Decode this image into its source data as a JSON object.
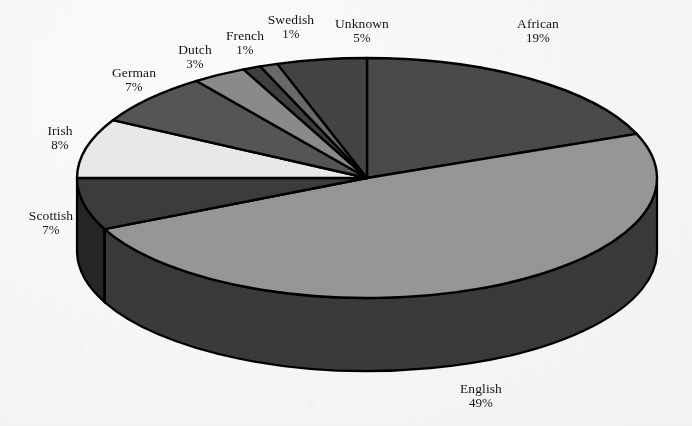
{
  "chart_data": {
    "type": "pie",
    "title": "",
    "subtitle": "",
    "xlabel": "",
    "ylabel": "",
    "legend_position": "none",
    "grid": false,
    "style": "3d-exploded-none",
    "label_format": "name + percent",
    "rotation_start_deg": 0,
    "direction": "clockwise",
    "categories": [
      "African",
      "English",
      "Scottish",
      "Irish",
      "German",
      "Dutch",
      "French",
      "Swedish",
      "Unknown"
    ],
    "values": [
      19,
      49,
      7,
      8,
      7,
      3,
      1,
      1,
      5
    ],
    "value_labels": [
      "19%",
      "49%",
      "7%",
      "8%",
      "7%",
      "3%",
      "1%",
      "1%",
      "5%"
    ],
    "unit": "%",
    "total": 100,
    "slices": [
      {
        "label": "African",
        "percent": 19,
        "percent_label": "19%",
        "color": "#4a4a4a",
        "side_color": "#2e2e2e"
      },
      {
        "label": "English",
        "percent": 49,
        "percent_label": "49%",
        "color": "#969696",
        "side_color": "#3a3a3a"
      },
      {
        "label": "Scottish",
        "percent": 7,
        "percent_label": "7%",
        "color": "#3c3c3c",
        "side_color": "#262626"
      },
      {
        "label": "Irish",
        "percent": 8,
        "percent_label": "8%",
        "color": "#e8e8e8",
        "side_color": "#4a4a4a"
      },
      {
        "label": "German",
        "percent": 7,
        "percent_label": "7%",
        "color": "#555555",
        "side_color": "#333333"
      },
      {
        "label": "Dutch",
        "percent": 3,
        "percent_label": "3%",
        "color": "#8a8a8a",
        "side_color": "#3a3a3a"
      },
      {
        "label": "French",
        "percent": 1,
        "percent_label": "1%",
        "color": "#3f3f3f",
        "side_color": "#272727"
      },
      {
        "label": "Swedish",
        "percent": 1,
        "percent_label": "1%",
        "color": "#6a6a6a",
        "side_color": "#303030"
      },
      {
        "label": "Unknown",
        "percent": 5,
        "percent_label": "5%",
        "color": "#444444",
        "side_color": "#2a2a2a"
      }
    ]
  },
  "labels": {
    "african": {
      "name": "African",
      "percent": "19%"
    },
    "english": {
      "name": "English",
      "percent": "49%"
    },
    "scottish": {
      "name": "Scottish",
      "percent": "7%"
    },
    "irish": {
      "name": "Irish",
      "percent": "8%"
    },
    "german": {
      "name": "German",
      "percent": "7%"
    },
    "dutch": {
      "name": "Dutch",
      "percent": "3%"
    },
    "french": {
      "name": "French",
      "percent": "1%"
    },
    "swedish": {
      "name": "Swedish",
      "percent": "1%"
    },
    "unknown": {
      "name": "Unknown",
      "percent": "5%"
    }
  },
  "colors": {
    "background": "#f6f6f6",
    "outline": "#000000",
    "text": "#15120f"
  }
}
